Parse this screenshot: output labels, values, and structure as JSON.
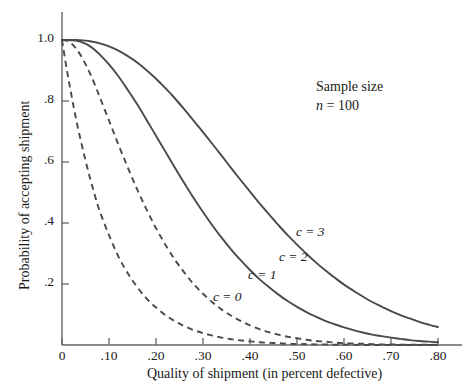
{
  "chart_data": {
    "type": "line",
    "title": "",
    "subtitle": "",
    "xlabel": "Quality of shipment (in percent defective)",
    "ylabel": "Probability of accepting shipment",
    "xlim": [
      0,
      0.8
    ],
    "ylim": [
      0,
      1.0
    ],
    "xticks": [
      0,
      0.1,
      0.2,
      0.3,
      0.4,
      0.5,
      0.6,
      0.7,
      0.8
    ],
    "xticklabels": [
      "0",
      ".10",
      ".20",
      ".30",
      ".40",
      ".50",
      ".60",
      ".70",
      ".80"
    ],
    "yticks": [
      0.2,
      0.4,
      0.6,
      0.8,
      1.0
    ],
    "yticklabels": [
      ".2",
      ".4",
      ".6",
      ".8",
      "1.0"
    ],
    "grid": false,
    "legend_position": "inline-curve-labels",
    "x": [
      0,
      0.01,
      0.02,
      0.03,
      0.04,
      0.05,
      0.06,
      0.07,
      0.08,
      0.1,
      0.12,
      0.14,
      0.16,
      0.18,
      0.2,
      0.22,
      0.24,
      0.26,
      0.28,
      0.3,
      0.32,
      0.34,
      0.36,
      0.38,
      0.4,
      0.42,
      0.44,
      0.46,
      0.48,
      0.5,
      0.52,
      0.54,
      0.56,
      0.58,
      0.6,
      0.62,
      0.64,
      0.66,
      0.68,
      0.7,
      0.72,
      0.74,
      0.76,
      0.78,
      0.8
    ],
    "series": [
      {
        "name": "c = 0",
        "label": "c = 0",
        "style": "dashed",
        "color": "#4a4a4a",
        "values": [
          1.0,
          0.905,
          0.82,
          0.74,
          0.67,
          0.605,
          0.545,
          0.49,
          0.44,
          0.36,
          0.29,
          0.235,
          0.19,
          0.152,
          0.123,
          0.098,
          0.078,
          0.062,
          0.049,
          0.039,
          0.031,
          0.024,
          0.019,
          0.015,
          0.012,
          0.009,
          0.007,
          0.006,
          0.004,
          0.003,
          0.003,
          0.002,
          0.002,
          0.001,
          0.001,
          0.001,
          0.0,
          0.0,
          0.0,
          0.0,
          0.0,
          0.0,
          0.0,
          0.0,
          0.0
        ]
      },
      {
        "name": "c = 1",
        "label": "c = 1",
        "style": "dashed",
        "color": "#4a4a4a",
        "values": [
          1.0,
          0.997,
          0.988,
          0.972,
          0.949,
          0.921,
          0.889,
          0.853,
          0.814,
          0.736,
          0.657,
          0.582,
          0.51,
          0.444,
          0.383,
          0.329,
          0.28,
          0.238,
          0.2,
          0.168,
          0.14,
          0.116,
          0.096,
          0.079,
          0.064,
          0.052,
          0.042,
          0.034,
          0.027,
          0.022,
          0.017,
          0.013,
          0.011,
          0.008,
          0.006,
          0.005,
          0.004,
          0.003,
          0.002,
          0.002,
          0.001,
          0.001,
          0.001,
          0.001,
          0.0
        ]
      },
      {
        "name": "c = 2",
        "label": "c = 2",
        "style": "solid",
        "color": "#4a4a4a",
        "values": [
          1.0,
          1.0,
          0.999,
          0.998,
          0.994,
          0.988,
          0.979,
          0.967,
          0.953,
          0.92,
          0.881,
          0.836,
          0.789,
          0.738,
          0.686,
          0.634,
          0.582,
          0.531,
          0.482,
          0.436,
          0.392,
          0.351,
          0.313,
          0.278,
          0.246,
          0.216,
          0.19,
          0.166,
          0.144,
          0.125,
          0.108,
          0.093,
          0.079,
          0.068,
          0.058,
          0.049,
          0.041,
          0.034,
          0.029,
          0.024,
          0.02,
          0.016,
          0.013,
          0.011,
          0.009
        ]
      },
      {
        "name": "c = 3",
        "label": "c = 3",
        "style": "solid",
        "color": "#4a4a4a",
        "values": [
          1.0,
          1.0,
          1.0,
          1.0,
          0.999,
          0.998,
          0.996,
          0.993,
          0.989,
          0.979,
          0.965,
          0.947,
          0.926,
          0.901,
          0.873,
          0.842,
          0.809,
          0.773,
          0.736,
          0.698,
          0.659,
          0.62,
          0.58,
          0.541,
          0.503,
          0.465,
          0.429,
          0.394,
          0.36,
          0.329,
          0.299,
          0.271,
          0.245,
          0.221,
          0.198,
          0.178,
          0.159,
          0.141,
          0.126,
          0.111,
          0.098,
          0.087,
          0.076,
          0.067,
          0.059
        ]
      }
    ],
    "annotations": [
      {
        "text": "Sample size",
        "x": 0.55,
        "y": 0.86
      },
      {
        "text": "n = 100",
        "x": 0.55,
        "y": 0.8
      }
    ]
  },
  "axes": {
    "x_title": "Quality of shipment (in percent defective)",
    "y_title": "Probability of accepting shipment",
    "x_tick_labels": [
      "0",
      ".10",
      ".20",
      ".30",
      ".40",
      ".50",
      ".60",
      ".70",
      ".80"
    ],
    "y_tick_labels": [
      "1.0",
      ".8",
      ".6",
      ".4",
      ".2"
    ]
  },
  "curve_labels": {
    "c0": "c = 0",
    "c1": "c = 1",
    "c2": "c = 2",
    "c3": "c = 3"
  },
  "annotation": {
    "line1": "Sample size",
    "line2_var": "n",
    "line2_rest": " = 100"
  },
  "colors": {
    "curve": "#4a4a4a",
    "axis": "#666666",
    "text": "#1a1a1a",
    "background": "#ffffff"
  }
}
